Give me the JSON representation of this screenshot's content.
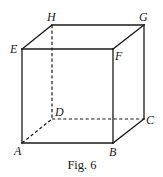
{
  "figure": {
    "caption": "Fig. 6",
    "type": "cube-perspective",
    "vertices": {
      "A": {
        "x": 22,
        "y": 143,
        "label": "A",
        "lx": 14,
        "ly": 155
      },
      "B": {
        "x": 113,
        "y": 143,
        "label": "B",
        "lx": 109,
        "ly": 156
      },
      "C": {
        "x": 144,
        "y": 119,
        "label": "C",
        "lx": 146,
        "ly": 124
      },
      "D": {
        "x": 52,
        "y": 119,
        "label": "D",
        "lx": 55,
        "ly": 116
      },
      "E": {
        "x": 22,
        "y": 49,
        "label": "E",
        "lx": 10,
        "ly": 53
      },
      "F": {
        "x": 113,
        "y": 49,
        "label": "F",
        "lx": 115,
        "ly": 60
      },
      "G": {
        "x": 144,
        "y": 25,
        "label": "G",
        "lx": 139,
        "ly": 21
      },
      "H": {
        "x": 52,
        "y": 25,
        "label": "H",
        "lx": 47,
        "ly": 21
      }
    },
    "edges": [
      {
        "from": "E",
        "to": "F",
        "style": "solid"
      },
      {
        "from": "F",
        "to": "G",
        "style": "solid"
      },
      {
        "from": "G",
        "to": "H",
        "style": "solid"
      },
      {
        "from": "H",
        "to": "E",
        "style": "solid"
      },
      {
        "from": "E",
        "to": "A",
        "style": "solid"
      },
      {
        "from": "F",
        "to": "B",
        "style": "solid"
      },
      {
        "from": "G",
        "to": "C",
        "style": "solid"
      },
      {
        "from": "A",
        "to": "B",
        "style": "solid"
      },
      {
        "from": "B",
        "to": "C",
        "style": "solid"
      },
      {
        "from": "H",
        "to": "D",
        "style": "dashed"
      },
      {
        "from": "A",
        "to": "D",
        "style": "dashed"
      },
      {
        "from": "D",
        "to": "C",
        "style": "dashed"
      }
    ],
    "colors": {
      "line": "#1a1a1a",
      "background": "#ffffff"
    }
  }
}
